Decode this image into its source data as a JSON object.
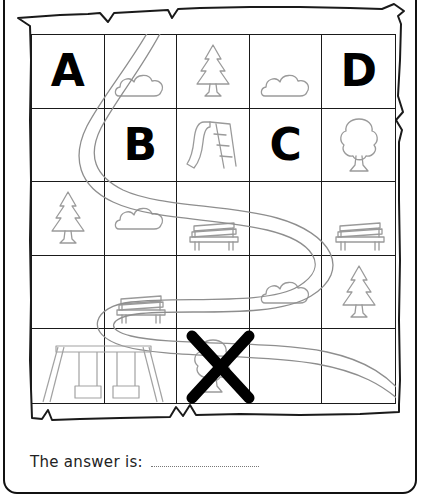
{
  "worksheet": {
    "answer_prompt": "The answer is:",
    "answer_value": "",
    "grid": {
      "rows": 5,
      "cols": 5,
      "cells": [
        {
          "r": 1,
          "c": 1,
          "kind": "letter",
          "label": "A"
        },
        {
          "r": 1,
          "c": 2,
          "kind": "icon",
          "label": "cloud"
        },
        {
          "r": 1,
          "c": 3,
          "kind": "icon",
          "label": "pine-tree"
        },
        {
          "r": 1,
          "c": 4,
          "kind": "icon",
          "label": "cloud"
        },
        {
          "r": 1,
          "c": 5,
          "kind": "letter",
          "label": "D"
        },
        {
          "r": 2,
          "c": 1,
          "kind": "empty",
          "label": ""
        },
        {
          "r": 2,
          "c": 2,
          "kind": "letter",
          "label": "B"
        },
        {
          "r": 2,
          "c": 3,
          "kind": "icon",
          "label": "slide"
        },
        {
          "r": 2,
          "c": 4,
          "kind": "letter",
          "label": "C"
        },
        {
          "r": 2,
          "c": 5,
          "kind": "icon",
          "label": "tree"
        },
        {
          "r": 3,
          "c": 1,
          "kind": "icon",
          "label": "pine-tree"
        },
        {
          "r": 3,
          "c": 2,
          "kind": "icon",
          "label": "cloud"
        },
        {
          "r": 3,
          "c": 3,
          "kind": "icon",
          "label": "bench"
        },
        {
          "r": 3,
          "c": 4,
          "kind": "empty",
          "label": ""
        },
        {
          "r": 3,
          "c": 5,
          "kind": "icon",
          "label": "bench"
        },
        {
          "r": 4,
          "c": 1,
          "kind": "empty",
          "label": ""
        },
        {
          "r": 4,
          "c": 2,
          "kind": "icon",
          "label": "bench"
        },
        {
          "r": 4,
          "c": 3,
          "kind": "empty",
          "label": ""
        },
        {
          "r": 4,
          "c": 4,
          "kind": "icon",
          "label": "cloud"
        },
        {
          "r": 4,
          "c": 5,
          "kind": "icon",
          "label": "pine-tree"
        },
        {
          "r": 5,
          "c": 1,
          "kind": "icon",
          "label": "swing-set"
        },
        {
          "r": 5,
          "c": 2,
          "kind": "empty",
          "label": ""
        },
        {
          "r": 5,
          "c": 3,
          "kind": "icon",
          "label": "tree-crossed-out"
        },
        {
          "r": 5,
          "c": 4,
          "kind": "empty",
          "label": ""
        },
        {
          "r": 5,
          "c": 5,
          "kind": "empty",
          "label": ""
        }
      ]
    },
    "colors": {
      "ink": "#1a1a1a",
      "letter": "#000000",
      "icon_outline": "#9a9a9a",
      "road": "#8c8c8c",
      "answer_text": "#222222",
      "blank_rule": "#777777",
      "page_background": "#ffffff"
    }
  }
}
